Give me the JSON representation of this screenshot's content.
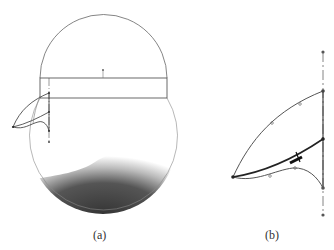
{
  "figure": {
    "panels": [
      {
        "id": "a",
        "label": "(a)",
        "description": "Wing-like sketch attached to a rectangle spanning a double-circle body with gradient-shaded lower half"
      },
      {
        "id": "b",
        "label": "(b)",
        "description": "Enlarged sketch profile: three curves from a tip point to a vertical centerline with points"
      }
    ]
  },
  "colors": {
    "line": "#555555",
    "dark_line": "#222222",
    "shade_dark": "#3a3a3a",
    "background": "#ffffff"
  }
}
